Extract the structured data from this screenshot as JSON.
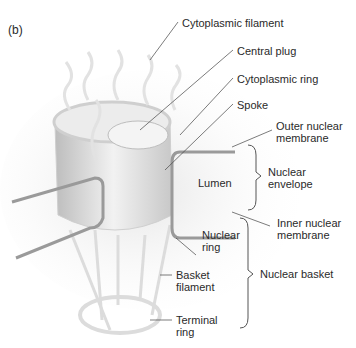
{
  "panel_label": "(b)",
  "labels": {
    "cytoplasmic_filament": "Cytoplasmic filament",
    "central_plug": "Central plug",
    "cytoplasmic_ring": "Cytoplasmic ring",
    "spoke": "Spoke",
    "outer_membrane_1": "Outer nuclear",
    "outer_membrane_2": "membrane",
    "lumen": "Lumen",
    "envelope_1": "Nuclear",
    "envelope_2": "envelope",
    "inner_membrane_1": "Inner nuclear",
    "inner_membrane_2": "membrane",
    "nuclear_ring_1": "Nuclear",
    "nuclear_ring_2": "ring",
    "basket_filament_1": "Basket",
    "basket_filament_2": "filament",
    "nuclear_basket": "Nuclear basket",
    "terminal_ring_1": "Terminal",
    "terminal_ring_2": "ring"
  }
}
